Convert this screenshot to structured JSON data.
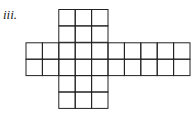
{
  "label": "iii.",
  "grid": {
    "cell": 16.4,
    "origin_x": 26,
    "origin_y": 9.5,
    "stroke": "#222222",
    "rows": [
      {
        "row": 0,
        "start_col": 2,
        "end_col": 5
      },
      {
        "row": 1,
        "start_col": 2,
        "end_col": 5
      },
      {
        "row": 2,
        "start_col": 0,
        "end_col": 10
      },
      {
        "row": 3,
        "start_col": 0,
        "end_col": 10
      },
      {
        "row": 4,
        "start_col": 2,
        "end_col": 5
      },
      {
        "row": 5,
        "start_col": 2,
        "end_col": 5
      }
    ]
  }
}
